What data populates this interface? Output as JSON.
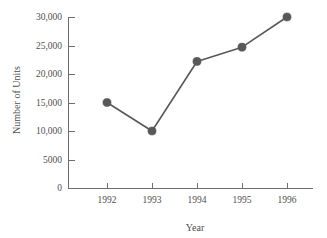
{
  "chart_data": {
    "type": "line",
    "title": "",
    "xlabel": "Year",
    "ylabel": "Number of Units",
    "categories": [
      "1992",
      "1993",
      "1994",
      "1995",
      "1996"
    ],
    "x": [
      1992,
      1993,
      1994,
      1995,
      1996
    ],
    "values": [
      15000,
      10000,
      22200,
      24700,
      30000
    ],
    "series": [
      {
        "name": "Number of Units",
        "values": [
          15000,
          10000,
          22200,
          24700,
          30000
        ],
        "color": "#585858",
        "marker": "circle"
      }
    ],
    "ylim": [
      0,
      30000
    ],
    "xlim": [
      1991.5,
      1996.5
    ],
    "yticks": [
      0,
      5000,
      10000,
      15000,
      20000,
      25000,
      30000
    ],
    "ytick_labels": [
      "0",
      "5000",
      "10,000",
      "15,000",
      "20,000",
      "25,000",
      "30,000"
    ],
    "xticks": [
      1992,
      1993,
      1994,
      1995,
      1996
    ],
    "xtick_labels": [
      "1992",
      "1993",
      "1994",
      "1995",
      "1996"
    ],
    "grid": false,
    "legend": null,
    "legend_position": "none",
    "annotations": [],
    "axis_color": "#6d6d6d",
    "text_color": "#4f4f4f",
    "background": "#ffffff"
  },
  "layout": {
    "plot_left": 68,
    "plot_right": 313,
    "plot_top": 17,
    "plot_bottom": 188,
    "tick_length": 6,
    "marker_radius": 4.1,
    "x_first_tick": 107,
    "x_tick_spacing": 45,
    "y_label_x": 20,
    "y_label_y": 100,
    "x_label_x": 195,
    "x_label_y": 231
  }
}
